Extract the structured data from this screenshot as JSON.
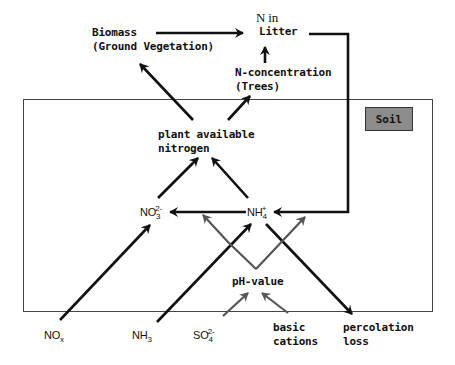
{
  "diagram": {
    "type": "nitrogen cycle flow diagram",
    "compartment": {
      "label": "Soil",
      "fill": "#8c8c8c"
    },
    "nodes": {
      "biomass": {
        "line1": "Biomass",
        "line2": "(Ground Vegetation)"
      },
      "n_in_litter": {
        "line1": "N in",
        "line2": "Litter"
      },
      "n_concentration": {
        "line1": "N-concentration",
        "line2": "(Trees)"
      },
      "plant_available_nitrogen": {
        "line1": "plant available",
        "line2": "nitrogen"
      },
      "nitrate": {
        "base": "NO",
        "sub": "3",
        "sup": "2-"
      },
      "ammonium": {
        "base": "NH",
        "sub": "4",
        "sup": "+"
      },
      "ph_value": {
        "label": "pH-value"
      },
      "nox": {
        "base": "NO",
        "sub": "x"
      },
      "nh3": {
        "base": "NH",
        "sub": "3"
      },
      "sulfate": {
        "base": "SO",
        "sub": "4",
        "sup": "2-"
      },
      "basic_cations": {
        "line1": "basic",
        "line2": "cations"
      },
      "percolation_loss": {
        "line1": "percolation",
        "line2": "loss"
      }
    },
    "edges": [
      {
        "from": "Biomass (Ground Vegetation)",
        "to": "N in Litter",
        "color": "#111111"
      },
      {
        "from": "N-concentration (Trees)",
        "to": "N in Litter",
        "color": "#111111"
      },
      {
        "from": "plant available nitrogen",
        "to": "Biomass (Ground Vegetation)",
        "color": "#111111"
      },
      {
        "from": "plant available nitrogen",
        "to": "N-concentration (Trees)",
        "color": "#111111"
      },
      {
        "from": "NO3 2-",
        "to": "plant available nitrogen",
        "color": "#111111"
      },
      {
        "from": "NH4 +",
        "to": "plant available nitrogen",
        "color": "#111111"
      },
      {
        "from": "N in Litter",
        "to": "NH4 +",
        "color": "#111111"
      },
      {
        "from": "NH4 +",
        "to": "NO3 2-",
        "color": "#111111"
      },
      {
        "from": "NOx",
        "to": "NO3 2-",
        "color": "#111111"
      },
      {
        "from": "NH3",
        "to": "NH4 +",
        "color": "#111111"
      },
      {
        "from": "NH4 +",
        "to": "percolation loss",
        "color": "#111111"
      },
      {
        "from": "pH-value",
        "to": "NO3 2-",
        "color": "#555555"
      },
      {
        "from": "pH-value",
        "to": "NH4 +",
        "color": "#555555"
      },
      {
        "from": "SO4 2-",
        "to": "pH-value",
        "color": "#555555"
      },
      {
        "from": "basic cations",
        "to": "pH-value",
        "color": "#555555"
      }
    ]
  }
}
